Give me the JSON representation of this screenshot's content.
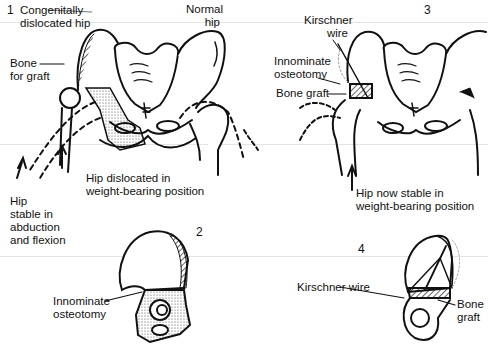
{
  "figure": {
    "panels": [
      {
        "number": "1",
        "labels": {
          "congenital": "Congenitally",
          "congenital2": "dislocated hip",
          "normal": "Normal",
          "normal2": "hip",
          "bone": "Bone",
          "bone2": "for graft",
          "dislocated": "Hip dislocated in",
          "dislocated2": "weight-bearing position",
          "stable": "Hip",
          "stable2": "stable in",
          "stable3": "abduction",
          "stable4": "and flexion"
        }
      },
      {
        "number": "2",
        "labels": {
          "osteo": "Innominate",
          "osteo2": "osteotomy"
        }
      },
      {
        "number": "3",
        "labels": {
          "wire": "Kirschner",
          "wire2": "wire",
          "osteo": "Innominate",
          "osteo2": "osteotomy",
          "graft": "Bone graft",
          "stable": "Hip now stable in",
          "stable2": "weight-bearing position"
        }
      },
      {
        "number": "4",
        "labels": {
          "wire": "Kirschner wire",
          "graft": "Bone",
          "graft2": "graft"
        }
      }
    ]
  }
}
